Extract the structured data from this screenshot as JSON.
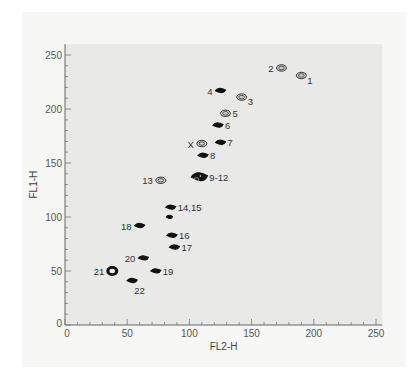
{
  "chart_data": {
    "type": "scatter",
    "subtype": "contour",
    "title": "",
    "xlabel": "FL2-H",
    "ylabel": "FL1-H",
    "xlim": [
      0,
      255
    ],
    "ylim": [
      0,
      260
    ],
    "xticks": [
      0,
      50,
      100,
      150,
      200,
      250
    ],
    "yticks": [
      0,
      50,
      100,
      150,
      200,
      250
    ],
    "grid": false,
    "legend": null,
    "plot_background": "#e9e9e7",
    "series": [
      {
        "name": "clusters",
        "points": [
          {
            "label": "1",
            "x": 190,
            "y": 231,
            "style": "open",
            "label_pos": "right-below"
          },
          {
            "label": "2",
            "x": 174,
            "y": 238,
            "style": "open",
            "label_pos": "left"
          },
          {
            "label": "3",
            "x": 142,
            "y": 211,
            "style": "open",
            "label_pos": "right-below"
          },
          {
            "label": "4",
            "x": 125,
            "y": 217,
            "style": "filled",
            "label_pos": "left"
          },
          {
            "label": "5",
            "x": 129,
            "y": 196,
            "style": "open",
            "label_pos": "right"
          },
          {
            "label": "6",
            "x": 123,
            "y": 185,
            "style": "filled",
            "label_pos": "right"
          },
          {
            "label": "7",
            "x": 125,
            "y": 169,
            "style": "filled",
            "label_pos": "right"
          },
          {
            "label": "X",
            "x": 110,
            "y": 168,
            "style": "open",
            "label_pos": "left"
          },
          {
            "label": "8",
            "x": 111,
            "y": 157,
            "style": "filled",
            "label_pos": "right"
          },
          {
            "label": "9-12",
            "x": 108,
            "y": 137,
            "style": "filled-large",
            "label_pos": "right"
          },
          {
            "label": "13",
            "x": 77,
            "y": 134,
            "style": "open",
            "label_pos": "left"
          },
          {
            "label": "14,15",
            "x": 85,
            "y": 109,
            "style": "filled",
            "label_pos": "right"
          },
          {
            "label": "",
            "x": 84,
            "y": 100,
            "style": "filled-small",
            "label_pos": "none"
          },
          {
            "label": "16",
            "x": 86,
            "y": 83,
            "style": "filled",
            "label_pos": "right"
          },
          {
            "label": "17",
            "x": 88,
            "y": 72,
            "style": "filled",
            "label_pos": "right"
          },
          {
            "label": "18",
            "x": 60,
            "y": 92,
            "style": "filled",
            "label_pos": "left"
          },
          {
            "label": "19",
            "x": 73,
            "y": 50,
            "style": "filled",
            "label_pos": "right"
          },
          {
            "label": "20",
            "x": 63,
            "y": 62,
            "style": "filled",
            "label_pos": "left"
          },
          {
            "label": "21",
            "x": 38,
            "y": 50,
            "style": "ring",
            "label_pos": "left"
          },
          {
            "label": "22",
            "x": 54,
            "y": 41,
            "style": "filled",
            "label_pos": "right-below"
          }
        ]
      }
    ]
  }
}
